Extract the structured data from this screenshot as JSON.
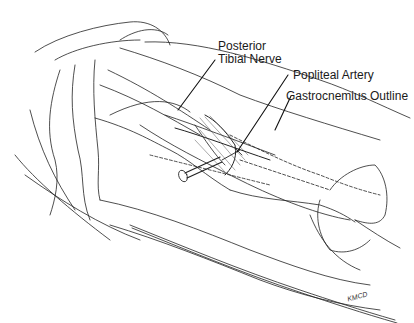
{
  "figure": {
    "type": "anatomical line illustration",
    "labels": {
      "posterior_tibial_nerve_line1": "Posterior",
      "posterior_tibial_nerve_line2": "Tibial Nerve",
      "popliteal_artery": "Popliteal Artery",
      "gastrocnemius_outline": "Gastrocnemius Outline"
    },
    "signature": "KMCD",
    "colors": {
      "ink": "#1a1a1a",
      "background": "#ffffff"
    }
  }
}
